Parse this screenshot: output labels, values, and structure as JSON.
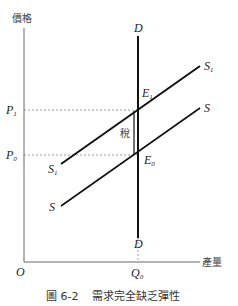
{
  "axes": {
    "y_label": "價格",
    "x_label": "產量",
    "origin": "O"
  },
  "prices": {
    "p1": {
      "main": "P",
      "sub": "1"
    },
    "p0": {
      "main": "P",
      "sub": "0"
    }
  },
  "quantity": {
    "q0": {
      "main": "Q",
      "sub": "0"
    }
  },
  "curves": {
    "demand_top": "D",
    "demand_bottom": "D",
    "s1_right": {
      "main": "S",
      "sub": "1"
    },
    "s1_left": {
      "main": "S",
      "sub": "1"
    },
    "s_right": "S",
    "s_left": "S"
  },
  "points": {
    "e1": {
      "main": "E",
      "sub": "1"
    },
    "e0": {
      "main": "E",
      "sub": "0"
    }
  },
  "tax_label": "稅",
  "caption": {
    "number": "圖 6-2",
    "title": "需求完全缺乏彈性"
  }
}
